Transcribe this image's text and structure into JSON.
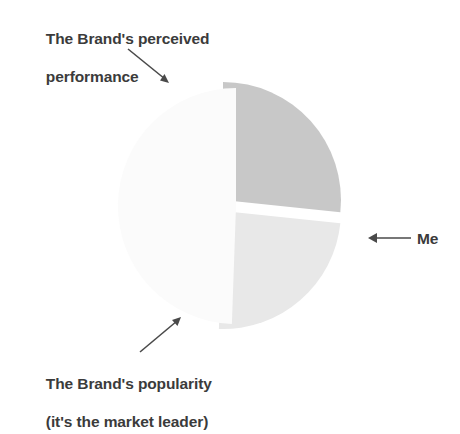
{
  "figure": {
    "background": "#ffffff",
    "text_color": "#3b3b3b",
    "arrow_color": "#4a4a4a"
  },
  "annotations": {
    "performance": {
      "line1": "The Brand's perceived",
      "line2": "performance",
      "arrow": "arrow-down-right"
    },
    "popularity": {
      "line1": "The Brand's popularity",
      "line2": "(it's the market leader)",
      "arrow": "arrow-up-right"
    },
    "me": {
      "label": "Me",
      "arrow": "arrow-left"
    }
  },
  "chart_data": {
    "type": "pie",
    "title": "",
    "exploded": true,
    "center": [
      230,
      205
    ],
    "radius": 118,
    "legend": "none",
    "labels": [
      "The Brand's perceived performance",
      "The Brand's popularity (it's the market leader)",
      "Me"
    ],
    "values": [
      27,
      24,
      49
    ],
    "slices": [
      {
        "name": "The Brand's perceived performance",
        "value": 27,
        "color": "#c8c8c8",
        "start_angle_deg": 270,
        "end_angle_deg": 366,
        "offset": [
          -7,
          -5
        ]
      },
      {
        "name": "The Brand's popularity (it's the market leader)",
        "value": 24,
        "color": "#e8e8e8",
        "start_angle_deg": 6,
        "end_angle_deg": 92,
        "offset": [
          -7,
          6
        ]
      },
      {
        "name": "Me",
        "value": 49,
        "color": "#fbfbfb",
        "start_angle_deg": 92,
        "end_angle_deg": 270,
        "offset": [
          6,
          1
        ]
      }
    ]
  }
}
